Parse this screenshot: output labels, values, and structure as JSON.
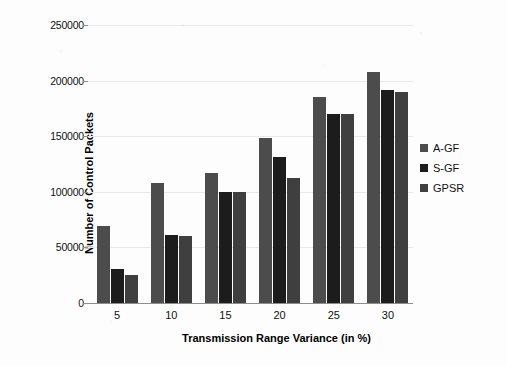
{
  "chart_data": {
    "type": "bar",
    "title": "",
    "xlabel": "Transmission Range Variance (in %)",
    "ylabel": "Number of Control Packets",
    "categories": [
      "5",
      "10",
      "15",
      "20",
      "25",
      "30"
    ],
    "series": [
      {
        "name": "A-GF",
        "color": "#4c4c4c",
        "values": [
          69000,
          108000,
          117000,
          148000,
          185000,
          208000
        ]
      },
      {
        "name": "S-GF",
        "color": "#1c1c1c",
        "values": [
          31000,
          61000,
          100000,
          131000,
          170000,
          192000
        ]
      },
      {
        "name": "GPSR",
        "color": "#3f3f3f",
        "values": [
          25000,
          60000,
          100000,
          112000,
          170000,
          190000
        ]
      }
    ],
    "ylim": [
      0,
      250000
    ],
    "yticks": [
      0,
      50000,
      100000,
      150000,
      200000,
      250000
    ],
    "ytick_labels": [
      "0",
      "50000",
      "100000",
      "150000",
      "200000",
      "250000"
    ],
    "grid": true,
    "legend_position": "right"
  }
}
